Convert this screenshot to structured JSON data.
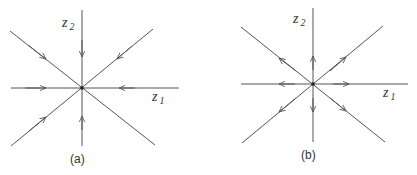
{
  "panels": [
    {
      "id": "a",
      "caption": "(a)",
      "axis_labels": {
        "z2": "z",
        "z2_sub": "2",
        "z1": "z",
        "z1_sub": "1"
      },
      "description": "stable node: trajectories flow toward origin"
    },
    {
      "id": "b",
      "caption": "(b)",
      "axis_labels": {
        "z2": "z",
        "z2_sub": "2",
        "z1": "z",
        "z1_sub": "1"
      },
      "description": "unstable node: trajectories flow away from origin"
    }
  ],
  "colors": {
    "line": "#555555",
    "text": "#333333"
  }
}
